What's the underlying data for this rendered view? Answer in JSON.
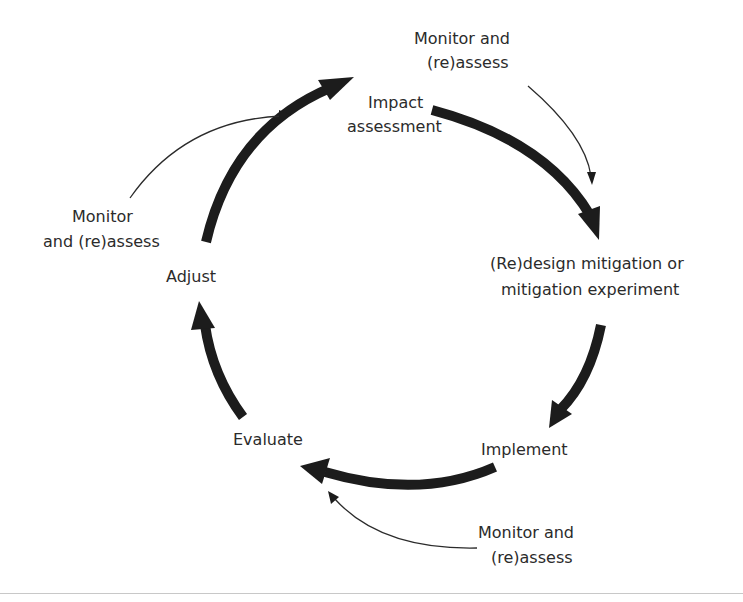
{
  "diagram": {
    "title": "",
    "type": "cycle",
    "nodes": [
      {
        "id": "impact",
        "lines": [
          "Impact",
          "assessment"
        ]
      },
      {
        "id": "redesign",
        "lines": [
          "(Re)design mitigation or",
          "mitigation experiment"
        ]
      },
      {
        "id": "implement",
        "lines": [
          "Implement"
        ]
      },
      {
        "id": "evaluate",
        "lines": [
          "Evaluate"
        ]
      },
      {
        "id": "adjust",
        "lines": [
          "Adjust"
        ]
      }
    ],
    "monitor_labels": [
      {
        "id": "monitor-top",
        "lines": [
          "Monitor and",
          "(re)assess"
        ],
        "points_to": "impact-to-redesign"
      },
      {
        "id": "monitor-left",
        "lines": [
          "Monitor",
          "and (re)assess"
        ],
        "points_to": "adjust-to-impact"
      },
      {
        "id": "monitor-bottom",
        "lines": [
          "Monitor and",
          "(re)assess"
        ],
        "points_to": "implement-to-evaluate"
      }
    ],
    "edges": [
      {
        "from": "adjust",
        "to": "impact"
      },
      {
        "from": "impact",
        "to": "redesign"
      },
      {
        "from": "redesign",
        "to": "implement"
      },
      {
        "from": "implement",
        "to": "evaluate"
      },
      {
        "from": "evaluate",
        "to": "adjust"
      }
    ],
    "colors": {
      "arrow": "#1c1c1c",
      "text": "#2b2b2b",
      "background": "#ffffff",
      "divider": "#c8c8c8"
    }
  }
}
